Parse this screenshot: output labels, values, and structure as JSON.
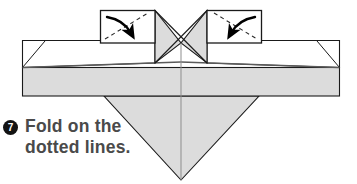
{
  "page": {
    "background_color": "#ffffff",
    "width": 357,
    "height": 184
  },
  "instruction": {
    "step_number": "7",
    "bullet_shape": "filled-circle",
    "bullet_bg_color": "#131313",
    "bullet_text_color": "#ffffff",
    "text_color": "#4a4a4a",
    "line1": "Fold on the",
    "line2": "dotted lines."
  },
  "diagram": {
    "colors": {
      "paper_fill": "#dcdcdc",
      "paper_fill_light": "#e4e4e4",
      "paper_white": "#ffffff",
      "outline": "#1a1a1a",
      "fold_shadow": "#555555",
      "dashed_line": "#2b2b2b",
      "arrow": "#000000"
    },
    "shapes": {
      "left_callout_box": {
        "x": 100,
        "y": 10,
        "w": 55,
        "h": 33
      },
      "right_callout_box": {
        "x": 207,
        "y": 10,
        "w": 55,
        "h": 33
      },
      "main_band": {
        "x": 22,
        "y": 40,
        "w": 318,
        "h": 56
      },
      "center_bowtie": {
        "cx": 181,
        "cy": 43
      },
      "bottom_triangle": {
        "left_x": 104,
        "right_x": 259,
        "apex_y": 180
      }
    },
    "annotations": {
      "left_arrow": "curved-arrow-down-right",
      "right_arrow": "curved-arrow-down-left",
      "left_dashed_fold": "dashed-diagonal-up-right",
      "right_dashed_fold": "dashed-diagonal-down-right",
      "center_crossing": "x-crossing-bowtie",
      "center_vertical_crease": "vertical-crease-line"
    }
  }
}
